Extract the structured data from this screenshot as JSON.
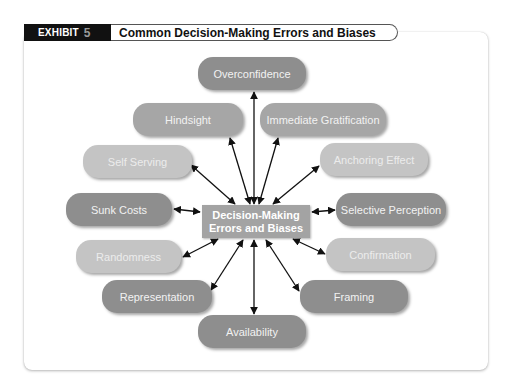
{
  "header": {
    "exhibit_label": "EXHIBIT",
    "exhibit_number": "5",
    "title": "Common Decision-Making Errors and Biases"
  },
  "center": {
    "line1": "Decision-Making",
    "line2": "Errors and Biases"
  },
  "nodes": [
    {
      "label": "Overconfidence",
      "shade": "dark"
    },
    {
      "label": "Hindsight",
      "shade": "mid"
    },
    {
      "label": "Immediate Gratification",
      "shade": "mid"
    },
    {
      "label": "Self Serving",
      "shade": "light"
    },
    {
      "label": "Anchoring Effect",
      "shade": "light"
    },
    {
      "label": "Sunk Costs",
      "shade": "dark"
    },
    {
      "label": "Selective Perception",
      "shade": "dark"
    },
    {
      "label": "Randomness",
      "shade": "light"
    },
    {
      "label": "Confirmation",
      "shade": "light"
    },
    {
      "label": "Representation",
      "shade": "dark"
    },
    {
      "label": "Framing",
      "shade": "dark"
    },
    {
      "label": "Availability",
      "shade": "dark"
    }
  ]
}
